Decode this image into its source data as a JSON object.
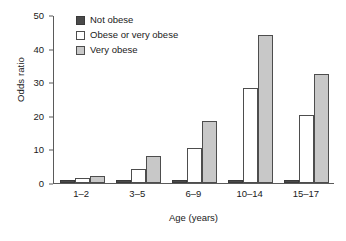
{
  "chart_data": {
    "type": "bar",
    "title": "",
    "subtitle": "",
    "xlabel": "Age (years)",
    "ylabel": "Odds ratio",
    "categories": [
      "1–2",
      "3–5",
      "6–9",
      "10–14",
      "15–17"
    ],
    "series": [
      {
        "name": "Not obese",
        "color": "#4a4a4a",
        "values": [
          1.0,
          1.0,
          1.0,
          1.0,
          1.0
        ]
      },
      {
        "name": "Obese or very obese",
        "color": "#ffffff",
        "values": [
          1.4,
          4.2,
          10.4,
          28.3,
          20.3
        ]
      },
      {
        "name": "Very obese",
        "color": "#c8c8c8",
        "values": [
          2.1,
          8.0,
          18.5,
          44.2,
          32.3
        ]
      }
    ],
    "ylim": [
      0,
      50
    ],
    "yticks": [
      0,
      10,
      20,
      30,
      40,
      50
    ],
    "ytick_labels": [
      "0",
      "10",
      "20",
      "30",
      "40",
      "50"
    ],
    "grid": false,
    "legend_position": "top-left",
    "axis_color": "#5a5a5a",
    "background": "#ffffff"
  }
}
